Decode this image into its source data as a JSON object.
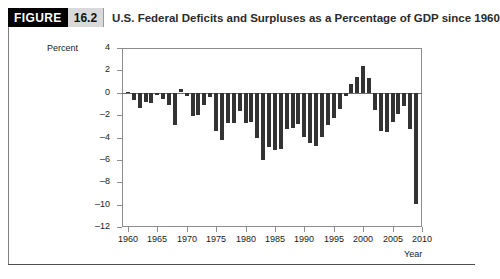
{
  "figure": {
    "badge": "FIGURE",
    "number": "16.2",
    "title": "U.S. Federal Deficits and Surpluses as a Percentage of GDP since 1960"
  },
  "chart_data": {
    "type": "bar",
    "title": "U.S. Federal Deficits and Surpluses as a Percentage of GDP since 1960",
    "xlabel": "Year",
    "ylabel": "Percent",
    "ylim": [
      -12,
      4
    ],
    "xlim": [
      1959,
      2010
    ],
    "ytick_labels": [
      "4",
      "2",
      "0",
      "-2",
      "-4",
      "-6",
      "-8",
      "-10",
      "-12"
    ],
    "ytick_values": [
      4,
      2,
      0,
      -2,
      -4,
      -6,
      -8,
      -10,
      -12
    ],
    "xtick_labels": [
      "1960",
      "1965",
      "1970",
      "1975",
      "1980",
      "1985",
      "1990",
      "1995",
      "2000",
      "2005",
      "2010"
    ],
    "xtick_values": [
      1960,
      1965,
      1970,
      1975,
      1980,
      1985,
      1990,
      1995,
      2000,
      2005,
      2010
    ],
    "grid": false,
    "legend": false,
    "bar_color": "#333333",
    "categories": [
      1960,
      1961,
      1962,
      1963,
      1964,
      1965,
      1966,
      1967,
      1968,
      1969,
      1970,
      1971,
      1972,
      1973,
      1974,
      1975,
      1976,
      1977,
      1978,
      1979,
      1980,
      1981,
      1982,
      1983,
      1984,
      1985,
      1986,
      1987,
      1988,
      1989,
      1990,
      1991,
      1992,
      1993,
      1994,
      1995,
      1996,
      1997,
      1998,
      1999,
      2000,
      2001,
      2002,
      2003,
      2004,
      2005,
      2006,
      2007,
      2008,
      2009
    ],
    "values": [
      0.1,
      -0.6,
      -1.3,
      -0.8,
      -0.9,
      -0.2,
      -0.5,
      -1.1,
      -2.9,
      0.3,
      -0.3,
      -2.1,
      -2.0,
      -1.1,
      -0.4,
      -3.4,
      -4.2,
      -2.7,
      -2.7,
      -1.6,
      -2.7,
      -2.6,
      -4.0,
      -6.0,
      -4.8,
      -5.1,
      -5.0,
      -3.2,
      -3.1,
      -2.8,
      -3.9,
      -4.5,
      -4.7,
      -3.9,
      -2.9,
      -2.2,
      -1.4,
      -0.3,
      0.8,
      1.4,
      2.4,
      1.3,
      -1.5,
      -3.4,
      -3.5,
      -2.6,
      -1.9,
      -1.2,
      -3.2,
      -9.9
    ],
    "notable": {
      "largest_deficit_year": 2009,
      "largest_deficit_value": -9.9,
      "largest_surplus_year": 2000,
      "largest_surplus_value": 2.4
    }
  }
}
